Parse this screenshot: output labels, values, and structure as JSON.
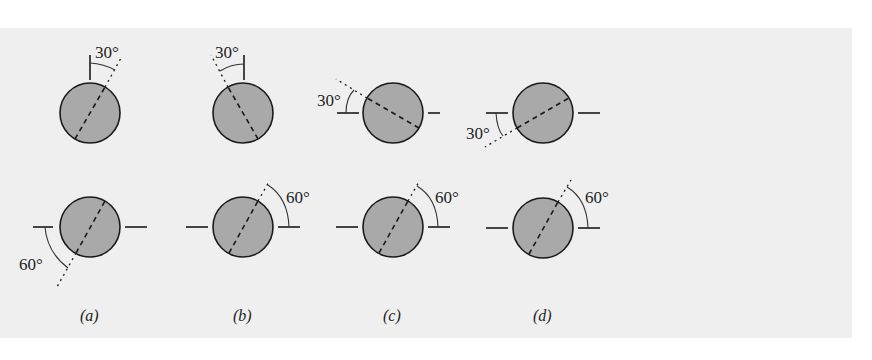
{
  "figure": {
    "background": "#efefef",
    "disk_fill": "#a9a9a9",
    "stroke_color": "#1a1a1a",
    "panels": [
      {
        "id": "a",
        "label": "(a)",
        "top": {
          "angle_label": "30°",
          "reference": "vertical",
          "tilt": "right"
        },
        "bottom": {
          "angle_label": "60°",
          "reference": "horizontal-left",
          "measured": "below"
        }
      },
      {
        "id": "b",
        "label": "(b)",
        "top": {
          "angle_label": "30°",
          "reference": "vertical",
          "tilt": "left"
        },
        "bottom": {
          "angle_label": "60°",
          "reference": "horizontal-right",
          "measured": "above"
        }
      },
      {
        "id": "c",
        "label": "(c)",
        "top": {
          "angle_label": "30°",
          "reference": "horizontal-left",
          "measured": "above"
        },
        "bottom": {
          "angle_label": "60°",
          "reference": "horizontal-right",
          "measured": "above"
        }
      },
      {
        "id": "d",
        "label": "(d)",
        "top": {
          "angle_label": "30°",
          "reference": "horizontal-left",
          "measured": "below"
        },
        "bottom": {
          "angle_label": "60°",
          "reference": "horizontal-right",
          "measured": "above"
        }
      }
    ]
  }
}
